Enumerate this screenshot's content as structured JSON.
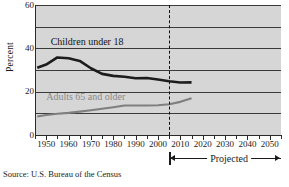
{
  "chart_data": {
    "type": "line",
    "title": "",
    "xlabel": "",
    "ylabel": "Percent",
    "xlim": [
      1945,
      2055
    ],
    "ylim": [
      0,
      60
    ],
    "grid": true,
    "grid_values": [
      10,
      20,
      30,
      40,
      50,
      60
    ],
    "y_tick_labels": [
      "0",
      "20",
      "40",
      "60"
    ],
    "y_tick_values": [
      0,
      20,
      40,
      60
    ],
    "x_tick_labels": [
      "1950",
      "1960",
      "1970",
      "1980",
      "1990",
      "2000",
      "2010",
      "2020",
      "2030",
      "2040",
      "2050"
    ],
    "x_tick_values": [
      1950,
      1960,
      1970,
      1980,
      1990,
      2000,
      2010,
      2020,
      2030,
      2040,
      2050
    ],
    "x_minor_values": [
      1945,
      1955,
      1965,
      1975,
      1985,
      1995,
      2005,
      2015,
      2025,
      2035,
      2045,
      2055
    ],
    "legend_position": "inline",
    "series": [
      {
        "name": "Children under 18",
        "color": "#1c1c1c",
        "label_x": 1952,
        "label_y": 43,
        "x": [
          1946,
          1950,
          1955,
          1960,
          1965,
          1970,
          1975,
          1980,
          1985,
          1990,
          1995,
          2000,
          2005,
          2010,
          2015
        ],
        "values": [
          31,
          32.5,
          35.8,
          35.4,
          34.2,
          30.8,
          28.2,
          27.3,
          26.9,
          26.2,
          26.3,
          25.6,
          24.8,
          24.2,
          24.3
        ]
      },
      {
        "name": "Adults 65 and older",
        "color": "#7f7f7f",
        "label_x": 1950,
        "label_y": 17.5,
        "x": [
          1946,
          1950,
          1955,
          1960,
          1965,
          1970,
          1975,
          1980,
          1985,
          1990,
          1995,
          2000,
          2005,
          2010,
          2015
        ],
        "values": [
          8.5,
          9.2,
          9.8,
          10.2,
          10.8,
          11.4,
          12.1,
          12.8,
          13.6,
          13.6,
          13.6,
          13.7,
          14.2,
          15.3,
          17.0
        ]
      }
    ],
    "annotations": [
      {
        "name": "projection-divider",
        "type": "vertical-dashed-line",
        "x": 2005
      },
      {
        "name": "projected-range",
        "type": "double-arrow",
        "label": "Projected",
        "x_start": 2005,
        "x_end": 2055
      }
    ],
    "source": "Source: U.S. Bureau of the Census"
  },
  "axes": {
    "y_title": "Percent"
  },
  "footer": {
    "source": "Source: U.S. Bureau of the Census"
  },
  "projection": {
    "label": "Projected"
  }
}
